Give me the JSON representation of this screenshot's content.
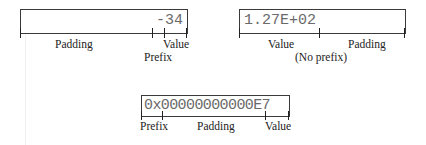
{
  "diagrams": [
    {
      "field_value": "-34",
      "labels": {
        "padding": "Padding",
        "prefix": "Prefix",
        "value": "Value"
      }
    },
    {
      "field_value": "1.27E+02",
      "labels": {
        "value": "Value",
        "padding": "Padding",
        "note": "(No prefix)"
      }
    },
    {
      "field_value": "0x00000000000E7",
      "labels": {
        "prefix": "Prefix",
        "padding": "Padding",
        "value": "Value"
      }
    }
  ],
  "colors": {
    "line": "#3a3a3a",
    "field_text": "#6a6a6a",
    "label_text": "#222222"
  }
}
